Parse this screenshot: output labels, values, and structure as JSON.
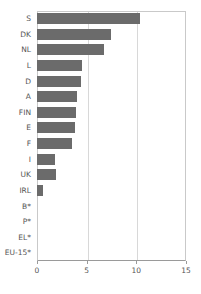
{
  "chart_data": {
    "type": "bar",
    "title": "",
    "subtitle": "",
    "xlabel": "",
    "ylabel": "",
    "orientation": "horizontal",
    "grid": true,
    "legend": false,
    "xlim": [
      0,
      15
    ],
    "xticks": [
      0,
      5,
      10,
      15
    ],
    "xtick_labels": [
      "0",
      "5",
      "10",
      "15"
    ],
    "bar_color": "#6b6b6b",
    "axis_color": "#9a9a9a",
    "grid_color": "#d8d8d8",
    "label_color": "#555555",
    "categories": [
      "S",
      "DK",
      "NL",
      "L",
      "D",
      "A",
      "FIN",
      "E",
      "F",
      "I",
      "UK",
      "IRL",
      "B*",
      "P*",
      "EL*",
      "EU-15*"
    ],
    "values": [
      10.4,
      7.4,
      6.7,
      4.5,
      4.4,
      4.0,
      3.9,
      3.8,
      3.5,
      1.8,
      1.9,
      0.6,
      0,
      0,
      0,
      0
    ]
  }
}
